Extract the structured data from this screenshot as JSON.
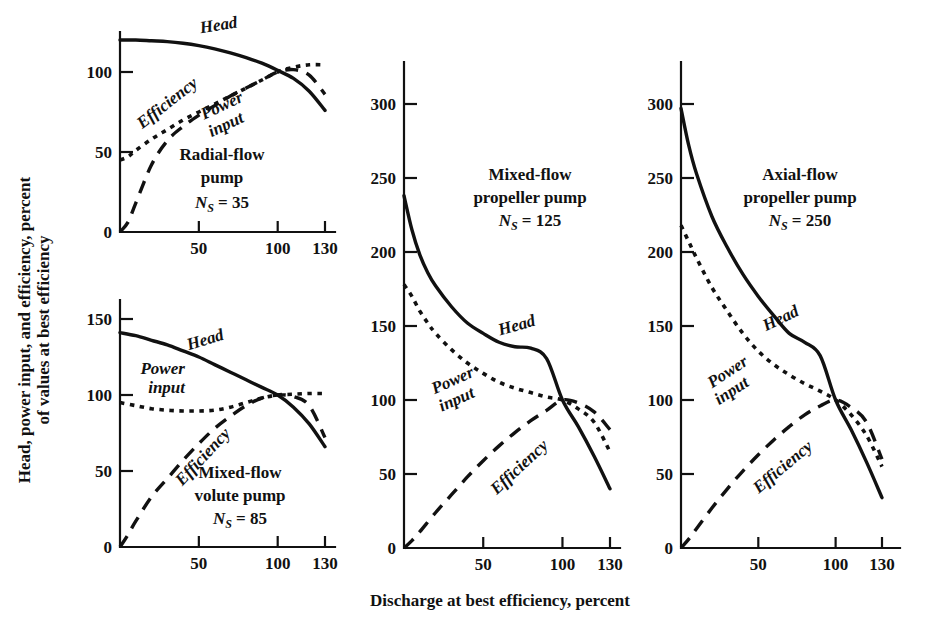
{
  "figure": {
    "xlabel": "Discharge at best efficiency, percent",
    "ylabel_line1": "Head, power input, and efficiency, percent",
    "ylabel_line2": "of values at best efficiency"
  },
  "chart_data": [
    {
      "id": "radial-flow-pump",
      "type": "line",
      "title": "Radial-flow pump",
      "title_line1": "Radial-flow",
      "title_line2": "pump",
      "ns_symbol": "N",
      "ns_subscript": "S",
      "ns_value": "= 35",
      "ns_label": "Ns = 35",
      "xlabel": "Discharge at best efficiency, percent",
      "ylabel": "Percent of values at best efficiency",
      "xlim": [
        0,
        135
      ],
      "ylim": [
        0,
        130
      ],
      "xticks": [
        50,
        100,
        130
      ],
      "yticks": [
        0,
        50,
        100
      ],
      "grid": false,
      "legend": "inline-labels",
      "series": [
        {
          "name": "Head",
          "style": "solid",
          "label_x": 63,
          "label_y": 126,
          "label_rotation": -9,
          "x": [
            0,
            10,
            20,
            30,
            40,
            50,
            60,
            70,
            80,
            90,
            100,
            110,
            120,
            130
          ],
          "y": [
            120,
            120,
            119.5,
            119,
            118,
            116.5,
            114.5,
            112,
            109,
            105.5,
            101,
            96,
            88,
            76
          ]
        },
        {
          "name": "Efficiency",
          "style": "long-dash",
          "label_x": 32,
          "label_y": 78,
          "label_rotation": -38,
          "x": [
            0,
            5,
            10,
            20,
            30,
            40,
            50,
            60,
            70,
            80,
            90,
            100,
            110,
            120,
            130
          ],
          "y": [
            0,
            6,
            18,
            42,
            57,
            66,
            73,
            79,
            85,
            90,
            95,
            100,
            101.5,
            98,
            86
          ]
        },
        {
          "name": "Power input",
          "style": "short-dash",
          "label_x": 66,
          "label_y": 76,
          "label_rotation": -25,
          "label_line1": "Power",
          "label_line2": "input",
          "x": [
            0,
            5,
            10,
            20,
            30,
            40,
            50,
            60,
            70,
            80,
            90,
            100,
            110,
            120,
            130
          ],
          "y": [
            45,
            47,
            51,
            58,
            64,
            70,
            75,
            80,
            85,
            90,
            95,
            100,
            103,
            104.5,
            104.5
          ]
        }
      ]
    },
    {
      "id": "mixed-flow-volute-pump",
      "type": "line",
      "title": "Mixed-flow volute pump",
      "title_line1": "Mixed-flow",
      "title_line2": "volute pump",
      "ns_symbol": "N",
      "ns_subscript": "S",
      "ns_value": "= 85",
      "ns_label": "Ns = 85",
      "xlim": [
        0,
        135
      ],
      "ylim": [
        0,
        165
      ],
      "xticks": [
        50,
        100,
        130
      ],
      "yticks": [
        0,
        50,
        100,
        150
      ],
      "grid": false,
      "series": [
        {
          "name": "Head",
          "style": "solid",
          "label_x": 55,
          "label_y": 133,
          "label_rotation": -17,
          "x": [
            0,
            10,
            20,
            30,
            40,
            50,
            60,
            70,
            80,
            90,
            100,
            110,
            120,
            130
          ],
          "y": [
            141,
            139,
            136,
            133,
            129,
            125,
            120,
            115,
            110,
            105,
            100,
            92,
            81,
            66
          ]
        },
        {
          "name": "Efficiency",
          "style": "long-dash",
          "label_x": 55,
          "label_y": 57,
          "label_rotation": -47,
          "x": [
            0,
            5,
            10,
            20,
            30,
            40,
            50,
            60,
            70,
            80,
            90,
            100,
            110,
            120,
            130
          ],
          "y": [
            0,
            8,
            17,
            33,
            45,
            57,
            68,
            78,
            86,
            93,
            98,
            100,
            99,
            93,
            72
          ]
        },
        {
          "name": "Power input",
          "style": "short-dash",
          "label_x": 27,
          "label_y": 114,
          "label_rotation": 0,
          "label_line1": "Power",
          "label_line2": "input",
          "x": [
            0,
            10,
            20,
            30,
            40,
            50,
            60,
            70,
            80,
            90,
            100,
            110,
            120,
            130
          ],
          "y": [
            95,
            93,
            91,
            90,
            89.5,
            89.5,
            90,
            92,
            95,
            98,
            100,
            100.5,
            101,
            101
          ]
        }
      ]
    },
    {
      "id": "mixed-flow-propeller-pump",
      "type": "line",
      "title": "Mixed-flow propeller pump",
      "title_line1": "Mixed-flow",
      "title_line2": "propeller pump",
      "ns_symbol": "N",
      "ns_subscript": "S",
      "ns_value": "= 125",
      "ns_label": "Ns = 125",
      "xlim": [
        0,
        135
      ],
      "ylim": [
        0,
        320
      ],
      "xticks": [
        50,
        100,
        130
      ],
      "yticks": [
        0,
        50,
        100,
        150,
        200,
        250,
        300
      ],
      "grid": false,
      "series": [
        {
          "name": "Head",
          "style": "solid",
          "label_x": 72,
          "label_y": 147,
          "label_rotation": -16,
          "x": [
            0,
            5,
            10,
            15,
            20,
            30,
            40,
            50,
            60,
            70,
            80,
            90,
            100,
            110,
            120,
            130
          ],
          "y": [
            238,
            215,
            198,
            186,
            177,
            163,
            152,
            145,
            139,
            136,
            135,
            128,
            100,
            82,
            62,
            40
          ]
        },
        {
          "name": "Efficiency",
          "style": "long-dash",
          "label_x": 75,
          "label_y": 52,
          "label_rotation": -43,
          "x": [
            0,
            5,
            10,
            20,
            30,
            40,
            50,
            60,
            70,
            80,
            90,
            100,
            110,
            120,
            130
          ],
          "y": [
            0,
            5,
            11,
            24,
            36,
            48,
            59,
            69,
            78,
            86,
            93,
            100,
            98,
            92,
            80
          ]
        },
        {
          "name": "Power input",
          "style": "short-dash",
          "label_x": 32,
          "label_y": 110,
          "label_rotation": -24,
          "label_line1": "Power",
          "label_line2": "input",
          "x": [
            0,
            5,
            10,
            15,
            20,
            30,
            40,
            50,
            60,
            70,
            80,
            90,
            100,
            110,
            120,
            130
          ],
          "y": [
            178,
            170,
            160,
            152,
            145,
            134,
            125,
            118,
            112,
            108,
            105,
            102,
            100,
            94,
            85,
            65
          ]
        }
      ]
    },
    {
      "id": "axial-flow-propeller-pump",
      "type": "line",
      "title": "Axial-flow propeller pump",
      "title_line1": "Axial-flow",
      "title_line2": "propeller pump",
      "ns_symbol": "N",
      "ns_subscript": "S",
      "ns_value": "= 250",
      "ns_label": "Ns = 250",
      "xlim": [
        0,
        135
      ],
      "ylim": [
        0,
        320
      ],
      "xticks": [
        50,
        100,
        130
      ],
      "yticks": [
        0,
        50,
        100,
        150,
        200,
        250,
        300
      ],
      "grid": false,
      "series": [
        {
          "name": "Head",
          "style": "solid",
          "label_x": 66,
          "label_y": 152,
          "label_rotation": -26,
          "x": [
            0,
            5,
            10,
            20,
            30,
            40,
            50,
            60,
            70,
            80,
            90,
            100,
            110,
            120,
            130
          ],
          "y": [
            297,
            272,
            253,
            224,
            203,
            185,
            170,
            157,
            145,
            139,
            130,
            100,
            80,
            58,
            34
          ]
        },
        {
          "name": "Efficiency",
          "style": "long-dash",
          "label_x": 68,
          "label_y": 52,
          "label_rotation": -40,
          "x": [
            0,
            5,
            10,
            20,
            30,
            40,
            50,
            60,
            70,
            80,
            90,
            100,
            110,
            120,
            130
          ],
          "y": [
            0,
            6,
            13,
            27,
            40,
            52,
            63,
            73,
            82,
            90,
            96,
            100,
            95,
            85,
            60
          ]
        },
        {
          "name": "Power input",
          "style": "short-dash",
          "label_x": 32,
          "label_y": 116,
          "label_rotation": -33,
          "label_line1": "Power",
          "label_line2": "input",
          "x": [
            0,
            5,
            10,
            20,
            30,
            40,
            50,
            60,
            70,
            80,
            90,
            100,
            110,
            120,
            130
          ],
          "y": [
            218,
            207,
            196,
            176,
            160,
            145,
            133,
            124,
            117,
            111,
            106,
            100,
            90,
            76,
            55
          ]
        }
      ]
    }
  ],
  "panel_geometry": [
    {
      "id": "radial-flow-pump",
      "x0": 120,
      "y0": 232,
      "x1": 335,
      "ypx_top": 32,
      "x_at_130": 325,
      "y_at_100": 72,
      "ns_x": 222,
      "ns_y": 208,
      "title_x": 222,
      "title_y": 160
    },
    {
      "id": "mixed-flow-volute-pump",
      "x0": 120,
      "y0": 547,
      "x1": 335,
      "ypx_top": 300,
      "x_at_130": 325,
      "y_at_100": 395,
      "ns_x": 240,
      "ns_y": 524,
      "title_x": 240,
      "title_y": 478
    },
    {
      "id": "mixed-flow-propeller-pump",
      "x0": 404,
      "y0": 548,
      "x1": 620,
      "ypx_top": 62,
      "x_at_130": 610,
      "y_at_100": 400,
      "ns_x": 530,
      "ns_y": 226,
      "title_x": 530,
      "title_y": 180
    },
    {
      "id": "axial-flow-propeller-pump",
      "x0": 681,
      "y0": 548,
      "x1": 900,
      "ypx_top": 62,
      "x_at_130": 882,
      "y_at_100": 400,
      "ns_x": 800,
      "ns_y": 226,
      "title_x": 800,
      "title_y": 180
    }
  ]
}
